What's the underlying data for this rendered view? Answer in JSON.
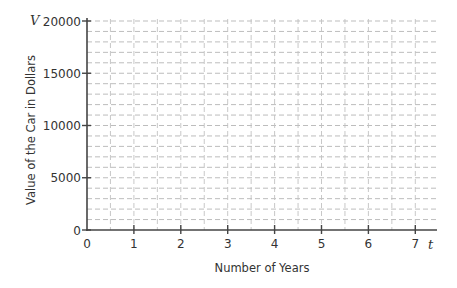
{
  "chart_data": {
    "type": "line",
    "title": "",
    "xlabel": "Number of Years",
    "ylabel": "Value of the Car in Dollars",
    "x_variable": "t",
    "y_variable": "V",
    "xlim": [
      0,
      7.4
    ],
    "ylim": [
      0,
      20000
    ],
    "x_ticks": [
      "0",
      "1",
      "2",
      "3",
      "4",
      "5",
      "6",
      "7"
    ],
    "y_ticks": [
      "0",
      "5000",
      "10000",
      "15000",
      "20000"
    ],
    "grid": true,
    "grid_style": "dashed",
    "x_minor_step": 0.5,
    "y_minor_step": 1000,
    "series": [],
    "legend": null
  }
}
